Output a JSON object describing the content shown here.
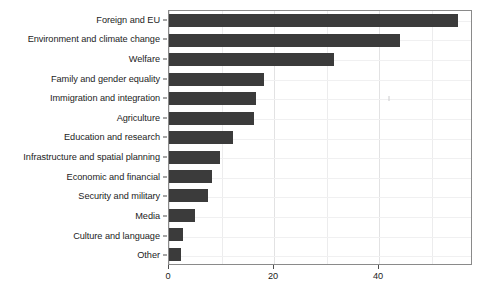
{
  "chart_data": {
    "type": "bar",
    "orientation": "horizontal",
    "title": "",
    "subtitle": "",
    "xlabel": "",
    "ylabel": "",
    "xlim": [
      0,
      57.9
    ],
    "xticks": [
      0,
      20,
      40
    ],
    "xticklabels": [
      "0",
      "20",
      "40"
    ],
    "grid": true,
    "grid_axis": "both",
    "legend": false,
    "legend_position": "none",
    "bar_color": "#3b3b3b",
    "panel_border_color": "#8a8a8a",
    "background_color": "#ffffff",
    "categories": [
      "Foreign and EU",
      "Environment and climate change",
      "Welfare",
      "Family and gender equality",
      "Immigration and integration",
      "Agriculture",
      "Education and research",
      "Infrastructure and spatial planning",
      "Economic and financial",
      "Security and military",
      "Media",
      "Culture and language",
      "Other"
    ],
    "values": [
      55.1,
      44.0,
      31.5,
      18.1,
      16.5,
      16.2,
      12.1,
      9.8,
      8.2,
      7.5,
      5.0,
      2.6,
      2.2
    ]
  }
}
